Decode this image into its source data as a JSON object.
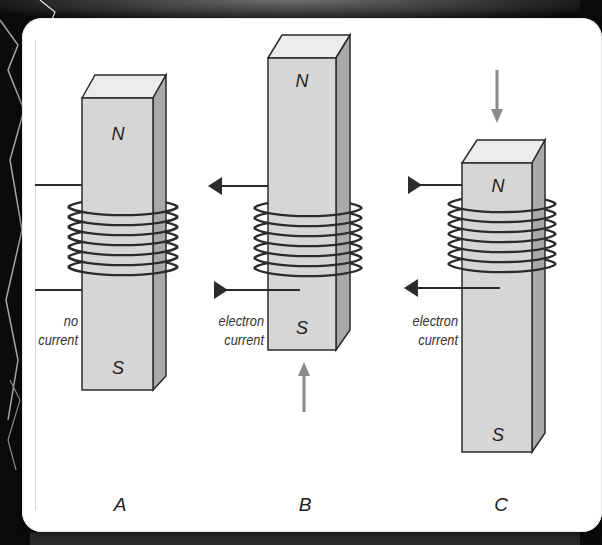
{
  "figure": {
    "panels": [
      {
        "id": "A",
        "label": "A",
        "north": "N",
        "south": "S",
        "caption_lines": [
          "no",
          "current"
        ],
        "magnet_motion": "none",
        "current_direction": "none"
      },
      {
        "id": "B",
        "label": "B",
        "north": "N",
        "south": "S",
        "caption_lines": [
          "electron",
          "current"
        ],
        "magnet_motion": "up",
        "current_direction": "in at bottom lead, out at top lead"
      },
      {
        "id": "C",
        "label": "C",
        "north": "N",
        "south": "S",
        "caption_lines": [
          "electron",
          "current"
        ],
        "magnet_motion": "down",
        "current_direction": "in at top lead, out at bottom lead"
      }
    ],
    "colors": {
      "magnet_front": "#d6d6d6",
      "magnet_top": "#ececec",
      "magnet_side": "#a9a9a9",
      "coil": "#2b2b2b",
      "motion_arrow": "#8a8a8a",
      "background": "#0b0b0b",
      "card": "#ffffff"
    }
  }
}
